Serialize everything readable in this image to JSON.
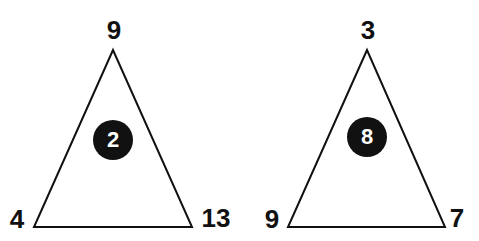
{
  "puzzle": {
    "triangles": [
      {
        "top": "9",
        "bottom_left": "4",
        "bottom_right": "13",
        "center": "2"
      },
      {
        "top": "3",
        "bottom_left": "9",
        "bottom_right": "7",
        "center": "8"
      }
    ],
    "colors": {
      "line": "#111111",
      "circle_fill": "#111111",
      "circle_text": "#ffffff",
      "background": "#ffffff"
    }
  }
}
